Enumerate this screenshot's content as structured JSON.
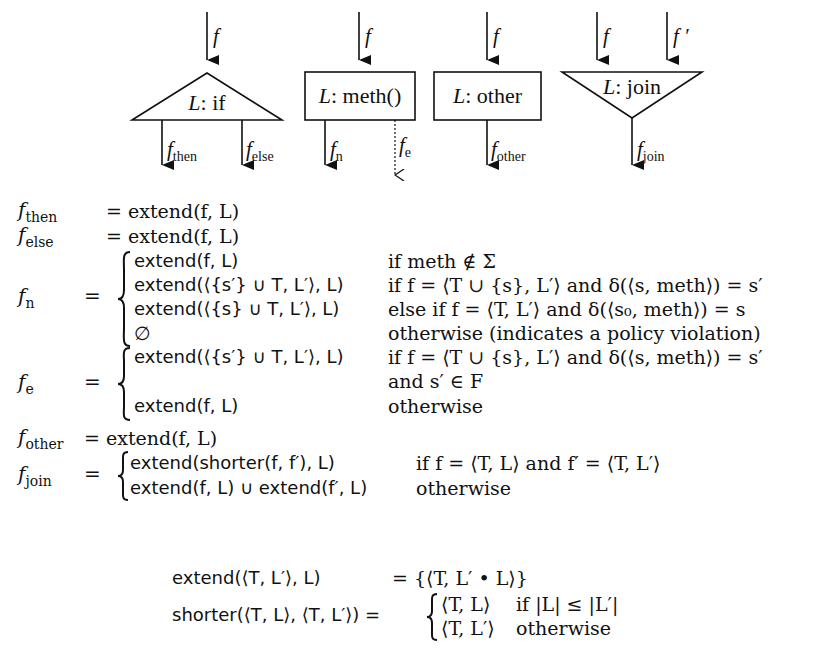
{
  "diagram": {
    "nodes": [
      {
        "id": "if",
        "shape": "triangle-up",
        "label_var": "L",
        "label_text": ": if",
        "inputs": [
          "f"
        ],
        "outputs": [
          {
            "base": "f",
            "sub": "then",
            "style": "solid"
          },
          {
            "base": "f",
            "sub": "else",
            "style": "solid"
          }
        ]
      },
      {
        "id": "meth",
        "shape": "box",
        "label_var": "L",
        "label_text": ": meth()",
        "inputs": [
          "f"
        ],
        "outputs": [
          {
            "base": "f",
            "sub": "n",
            "style": "solid"
          },
          {
            "base": "f",
            "sub": "e",
            "style": "dotted"
          }
        ]
      },
      {
        "id": "other",
        "shape": "box",
        "label_var": "L",
        "label_text": ": other",
        "inputs": [
          "f"
        ],
        "outputs": [
          {
            "base": "f",
            "sub": "other",
            "style": "solid"
          }
        ]
      },
      {
        "id": "join",
        "shape": "triangle-down",
        "label_var": "L",
        "label_text": ": join",
        "inputs": [
          "f",
          "f ′"
        ],
        "outputs": [
          {
            "base": "f",
            "sub": "join",
            "style": "solid"
          }
        ]
      }
    ]
  },
  "equations": {
    "then": {
      "lhs_base": "f",
      "lhs_sub": "then",
      "rhs": "= extend(f, L)"
    },
    "else": {
      "lhs_base": "f",
      "lhs_sub": "else",
      "rhs": "= extend(f, L)"
    },
    "n": {
      "lhs_base": "f",
      "lhs_sub": "n",
      "cases": [
        {
          "value": "extend(f, L)",
          "condition": "if meth ∉ Σ"
        },
        {
          "value": "extend(⟨{s′} ∪ T, L′⟩, L)",
          "condition": "if f = ⟨T ∪ {s}, L′⟩ and δ(⟨s, meth⟩) = s′"
        },
        {
          "value": "extend(⟨{s} ∪ T, L′⟩, L)",
          "condition": "else if f = ⟨T, L′⟩ and δ(⟨s₀, meth⟩) = s"
        },
        {
          "value": "∅",
          "condition": "otherwise (indicates a policy violation)"
        }
      ]
    },
    "e": {
      "lhs_base": "f",
      "lhs_sub": "e",
      "cases": [
        {
          "value": "extend(⟨{s′} ∪ T, L′⟩, L)",
          "condition": "if f = ⟨T ∪ {s}, L′⟩ and δ(⟨s, meth⟩) = s′"
        },
        {
          "value": "",
          "condition": "and s′ ∈ F"
        },
        {
          "value": "extend(f, L)",
          "condition": "otherwise"
        }
      ]
    },
    "other": {
      "lhs_base": "f",
      "lhs_sub": "other",
      "rhs": "= extend(f, L)"
    },
    "join": {
      "lhs_base": "f",
      "lhs_sub": "join",
      "cases": [
        {
          "value": "extend(shorter(f, f′), L)",
          "condition": "if f = ⟨T, L⟩ and f′ = ⟨T, L′⟩"
        },
        {
          "value": "extend(f, L) ∪ extend(f′, L)",
          "condition": "otherwise"
        }
      ]
    },
    "extend_def": {
      "lhs": "extend(⟨T, L′⟩, L)",
      "rhs": "= {⟨T, L′ • L⟩}"
    },
    "shorter_def": {
      "lhs": "shorter(⟨T, L⟩, ⟨T, L′⟩) =",
      "cases": [
        {
          "value": "⟨T, L⟩",
          "condition": "if |L| ≤ |L′|"
        },
        {
          "value": "⟨T, L′⟩",
          "condition": "otherwise"
        }
      ]
    }
  }
}
